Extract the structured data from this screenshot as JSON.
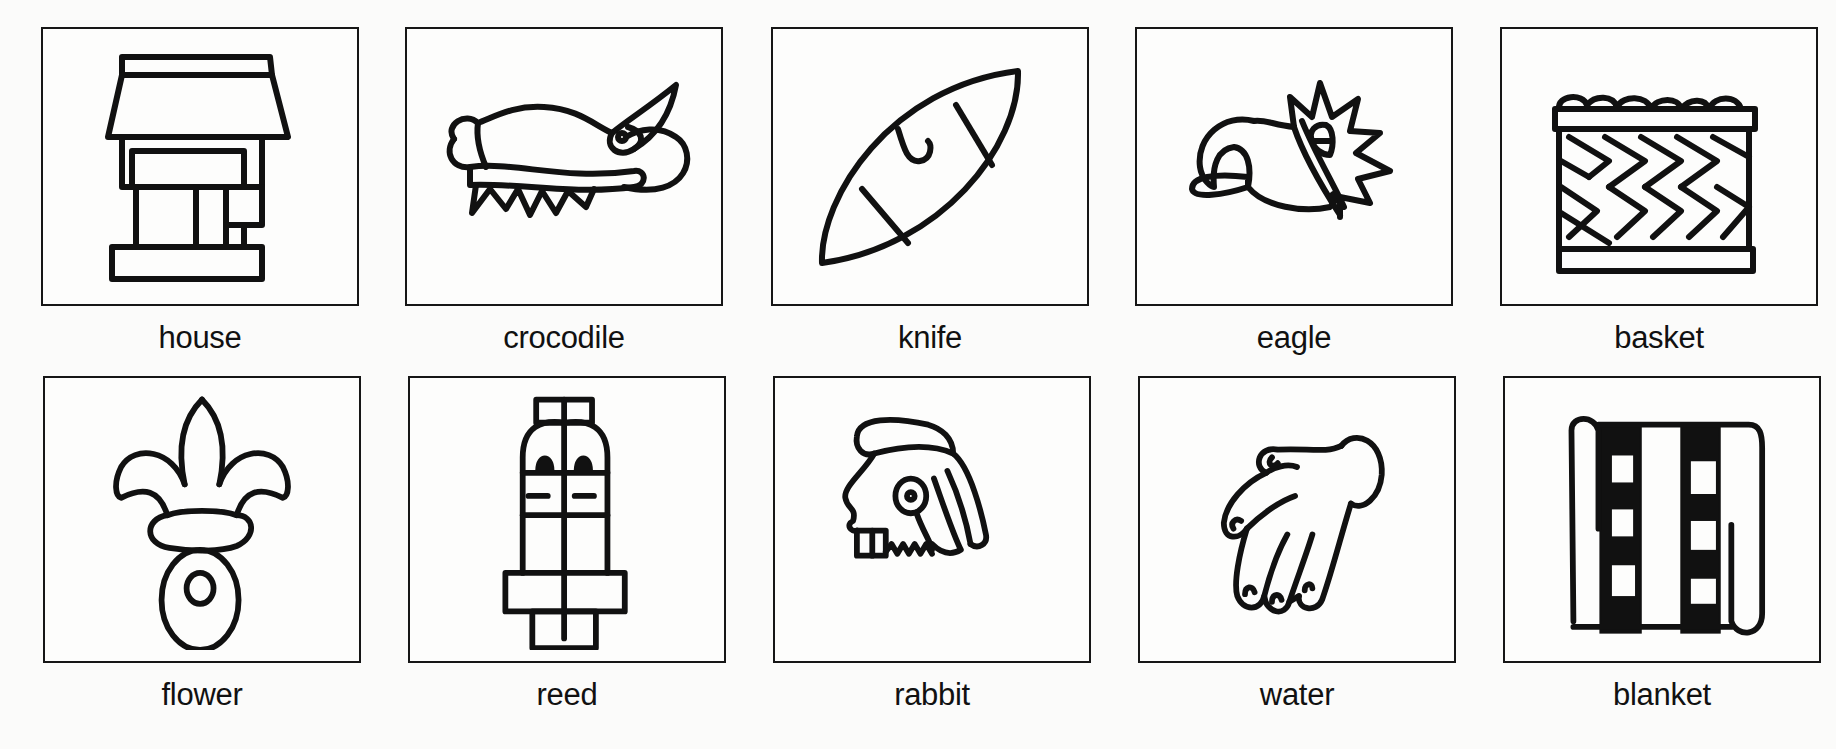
{
  "glyphs": [
    {
      "label": "house",
      "icon": "house-glyph"
    },
    {
      "label": "crocodile",
      "icon": "crocodile-glyph"
    },
    {
      "label": "knife",
      "icon": "knife-glyph"
    },
    {
      "label": "eagle",
      "icon": "eagle-glyph"
    },
    {
      "label": "basket",
      "icon": "basket-glyph"
    },
    {
      "label": "flower",
      "icon": "flower-glyph"
    },
    {
      "label": "reed",
      "icon": "reed-glyph"
    },
    {
      "label": "rabbit",
      "icon": "rabbit-glyph"
    },
    {
      "label": "water",
      "icon": "water-glyph"
    },
    {
      "label": "blanket",
      "icon": "blanket-glyph"
    }
  ],
  "colors": {
    "ink": "#111111",
    "paper": "#fbfbfa"
  }
}
